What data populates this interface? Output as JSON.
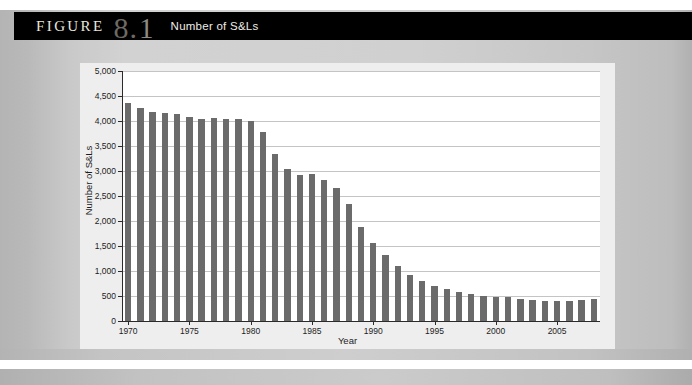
{
  "figure": {
    "label": "FIGURE",
    "number": "8",
    "dot": ".",
    "sub": "1",
    "title": "Number of S&Ls"
  },
  "chart_data": {
    "type": "bar",
    "title": "Number of S&Ls",
    "xlabel": "Year",
    "ylabel": "Number of S&Ls",
    "ylim": [
      0,
      5000
    ],
    "ytick_step": 500,
    "ytick_labels": [
      "0",
      "500",
      "1,000",
      "1,500",
      "2,000",
      "2,500",
      "3,000",
      "3,500",
      "4,000",
      "4,500",
      "5,000"
    ],
    "xtick_labels": [
      "1970",
      "1975",
      "1980",
      "1985",
      "1990",
      "1995",
      "2000",
      "2005"
    ],
    "grid": true,
    "legend": "none",
    "bar_color": "#6b6b6b",
    "categories": [
      1970,
      1971,
      1972,
      1973,
      1974,
      1975,
      1976,
      1977,
      1978,
      1979,
      1980,
      1981,
      1982,
      1983,
      1984,
      1985,
      1986,
      1987,
      1988,
      1989,
      1990,
      1991,
      1992,
      1993,
      1994,
      1995,
      1996,
      1997,
      1998,
      1999,
      2000,
      2001,
      2002,
      2003,
      2004,
      2005,
      2006,
      2007,
      2008
    ],
    "values": [
      4360,
      4270,
      4180,
      4170,
      4140,
      4080,
      4050,
      4060,
      4050,
      4040,
      4000,
      3780,
      3350,
      3050,
      2920,
      2950,
      2820,
      2660,
      2340,
      1890,
      1560,
      1330,
      1110,
      920,
      810,
      710,
      640,
      590,
      550,
      510,
      490,
      480,
      450,
      430,
      410,
      400,
      410,
      420,
      440
    ]
  }
}
